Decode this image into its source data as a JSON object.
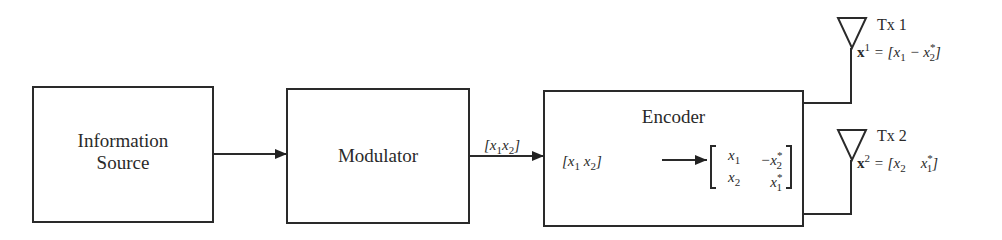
{
  "blocks": {
    "source": {
      "line1": "Information",
      "line2": "Source"
    },
    "modulator": {
      "label": "Modulator"
    },
    "encoder": {
      "label": "Encoder"
    }
  },
  "signals": {
    "mod_out": "[x1 x2]",
    "enc_in": "[x1 x2]",
    "matrix": [
      [
        "x1",
        "-x2*"
      ],
      [
        "x2",
        "x1*"
      ]
    ]
  },
  "antennas": [
    {
      "label": "Tx 1",
      "equation": "x^1 = [x1 - x2*]"
    },
    {
      "label": "Tx 2",
      "equation": "x^2 = [x2  x1*]"
    }
  ]
}
